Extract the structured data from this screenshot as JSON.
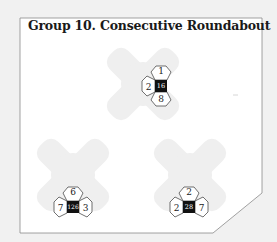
{
  "title": "Group 10. Consecutive Roundabout",
  "colors": {
    "page_bg": "#f1f1f1",
    "frame_fill": "#ffffff",
    "frame_stroke": "#8a8a8a",
    "blob": "#efefef",
    "cell_fill": "#ffffff",
    "cell_stroke": "#333333",
    "center_fill": "#111111",
    "center_text": "#ffffff",
    "text": "#222222"
  },
  "clusters": [
    {
      "id": "top",
      "blob_center": [
        143,
        84
      ],
      "center": [
        161,
        86
      ],
      "center_value": "16",
      "cells": {
        "top": "1",
        "left": "2",
        "bottom": "8"
      }
    },
    {
      "id": "bottom-left",
      "blob_center": [
        73,
        175
      ],
      "center": [
        73,
        207
      ],
      "center_value": "126",
      "cells": {
        "top": "6",
        "left": "7",
        "right": "3"
      }
    },
    {
      "id": "bottom-right",
      "blob_center": [
        190,
        175
      ],
      "center": [
        189,
        207
      ],
      "center_value": "28",
      "cells": {
        "top": "2",
        "left": "2",
        "right": "7"
      }
    }
  ]
}
